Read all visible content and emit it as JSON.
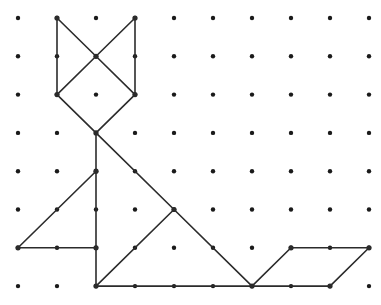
{
  "canvas": {
    "width": 381,
    "height": 305,
    "background_color": "#ffffff",
    "title": "Geoboard Fox Figure"
  },
  "grid": {
    "name": "dot-grid",
    "columns": 10,
    "rows": 8,
    "origin_x": 18,
    "origin_y": 18,
    "spacing_x": 39,
    "spacing_y": 38.3,
    "dot_radius": 2.2,
    "dot_color": "#1a1a1a"
  },
  "figure": {
    "name": "fox-polygon-figure",
    "stroke_color": "#2b2b2b",
    "stroke_width": 1.6,
    "vertex_radius": 2.6,
    "parts": [
      {
        "name": "left-ear",
        "segments": [
          [
            1,
            0,
            1,
            2
          ],
          [
            1,
            0,
            2,
            1
          ]
        ]
      },
      {
        "name": "right-ear",
        "segments": [
          [
            3,
            0,
            3,
            2
          ],
          [
            3,
            0,
            2,
            1
          ]
        ]
      },
      {
        "name": "head-diamond",
        "segments": [
          [
            2,
            1,
            1,
            2
          ],
          [
            2,
            1,
            3,
            2
          ],
          [
            1,
            2,
            2,
            3
          ],
          [
            3,
            2,
            2,
            3
          ]
        ]
      },
      {
        "name": "neck-and-back",
        "segments": [
          [
            2,
            3,
            2,
            7
          ],
          [
            2,
            3,
            4,
            5
          ]
        ]
      },
      {
        "name": "front-leg-triangle",
        "segments": [
          [
            2,
            4,
            0,
            6
          ],
          [
            0,
            6,
            2,
            6
          ]
        ]
      },
      {
        "name": "body-haunch",
        "segments": [
          [
            4,
            5,
            6,
            7
          ],
          [
            4,
            5,
            2,
            7
          ]
        ]
      },
      {
        "name": "belly-baseline",
        "segments": [
          [
            2,
            7,
            8,
            7
          ]
        ]
      },
      {
        "name": "tail-parallelogram",
        "segments": [
          [
            6,
            7,
            7,
            6
          ],
          [
            7,
            6,
            9,
            6
          ],
          [
            9,
            6,
            8,
            7
          ]
        ]
      }
    ]
  },
  "legend": {
    "shape_name": "Fox",
    "segment_count": 17,
    "lattice_points_total": 80
  }
}
